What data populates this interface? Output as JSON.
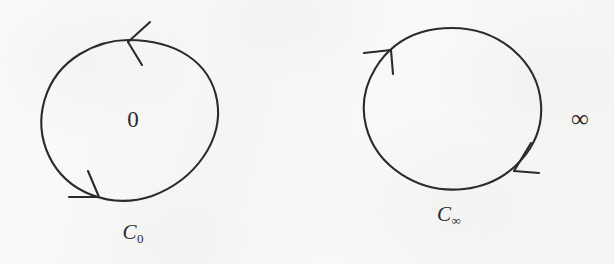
{
  "figure": {
    "kind": "hand-drawn-math-diagram",
    "background_color": "#f7f7f6",
    "ink_color": "#2b2b2b"
  },
  "contours": [
    {
      "id": "c-zero",
      "caption_base": "C",
      "caption_sub": "0",
      "caption_full": "C₀",
      "interior_label": "0",
      "orientation": "counterclockwise",
      "center": {
        "x": 129,
        "y": 121
      },
      "radius": {
        "x": 88,
        "y": 81
      },
      "caption_position": {
        "x": 133,
        "y": 233
      },
      "interior_label_position": {
        "x": 133,
        "y": 119
      },
      "arrows": [
        {
          "name": "top-arrowhead",
          "tip": {
            "x": 128,
            "y": 42
          },
          "points": "left"
        },
        {
          "name": "bottom-arrowhead",
          "tip": {
            "x": 98,
            "y": 196
          },
          "points": "right"
        }
      ]
    },
    {
      "id": "c-infinity",
      "caption_base": "C",
      "caption_sub": "∞",
      "caption_full": "C∞",
      "exterior_label": "∞",
      "orientation": "counterclockwise",
      "center": {
        "x": 452,
        "y": 109
      },
      "radius": {
        "x": 89,
        "y": 81
      },
      "caption_position": {
        "x": 449,
        "y": 215
      },
      "exterior_label_position": {
        "x": 580,
        "y": 118
      },
      "arrows": [
        {
          "name": "upper-left-arrowhead",
          "tip": {
            "x": 390,
            "y": 50
          },
          "points": "up-left"
        },
        {
          "name": "lower-right-arrowhead",
          "tip": {
            "x": 515,
            "y": 170
          },
          "points": "down-left"
        }
      ]
    }
  ],
  "labels": {
    "zero_digit": "0",
    "infinity_symbol": "∞",
    "c_letter": "C",
    "caption_left": "C₀",
    "caption_right": "C∞"
  }
}
